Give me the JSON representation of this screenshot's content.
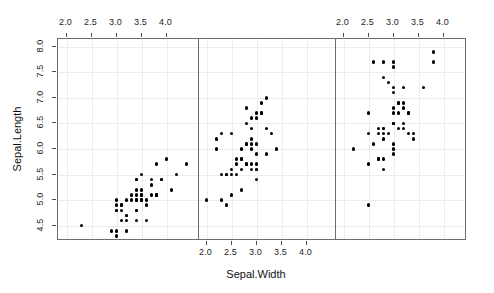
{
  "chart_data": {
    "type": "scatter",
    "title": "",
    "xlabel": "Sepal.Width",
    "ylabel": "Sepal.Length",
    "xlim": [
      1.85,
      4.55
    ],
    "ylim": [
      4.2,
      8.15
    ],
    "xticks": [
      2.0,
      2.5,
      3.0,
      3.5,
      4.0
    ],
    "xticklabels": [
      "2.0",
      "2.5",
      "3.0",
      "3.5",
      "4.0"
    ],
    "yticks": [
      4.5,
      5.0,
      5.5,
      6.0,
      6.5,
      7.0,
      7.5,
      8.0
    ],
    "yticklabels": [
      "4.5",
      "5.0",
      "5.5",
      "6.0",
      "6.5",
      "7.0",
      "7.5",
      "8.0"
    ],
    "grid": true,
    "legend": "none",
    "point_color": "#000000",
    "frame_color": "#6e6e6e",
    "grid_color": "#ececec",
    "conditioned": true,
    "panel_count": 3,
    "panels": [
      {
        "name": "panel-1",
        "axis_position": "top",
        "points": [
          [
            3.5,
            5.1
          ],
          [
            3.0,
            4.9
          ],
          [
            3.2,
            4.7
          ],
          [
            3.1,
            4.6
          ],
          [
            3.6,
            5.0
          ],
          [
            3.9,
            5.4
          ],
          [
            3.4,
            4.6
          ],
          [
            3.4,
            5.0
          ],
          [
            2.9,
            4.4
          ],
          [
            3.1,
            4.9
          ],
          [
            3.7,
            5.4
          ],
          [
            3.4,
            4.8
          ],
          [
            3.0,
            4.8
          ],
          [
            3.0,
            4.3
          ],
          [
            4.0,
            5.8
          ],
          [
            4.4,
            5.7
          ],
          [
            3.9,
            5.4
          ],
          [
            3.5,
            5.1
          ],
          [
            3.8,
            5.7
          ],
          [
            3.8,
            5.1
          ],
          [
            3.4,
            5.4
          ],
          [
            3.7,
            5.1
          ],
          [
            3.6,
            4.6
          ],
          [
            3.3,
            5.1
          ],
          [
            3.4,
            4.8
          ],
          [
            3.0,
            5.0
          ],
          [
            3.4,
            5.0
          ],
          [
            3.5,
            5.2
          ],
          [
            3.4,
            5.2
          ],
          [
            3.2,
            4.7
          ],
          [
            3.1,
            4.8
          ],
          [
            3.4,
            5.4
          ],
          [
            4.1,
            5.2
          ],
          [
            4.2,
            5.5
          ],
          [
            3.1,
            4.9
          ],
          [
            3.2,
            5.0
          ],
          [
            3.5,
            5.5
          ],
          [
            3.6,
            4.9
          ],
          [
            3.0,
            4.4
          ],
          [
            3.4,
            5.1
          ],
          [
            3.5,
            5.0
          ],
          [
            2.3,
            4.5
          ],
          [
            3.2,
            4.4
          ],
          [
            3.5,
            5.0
          ],
          [
            3.8,
            5.1
          ],
          [
            3.0,
            4.8
          ],
          [
            3.8,
            5.1
          ],
          [
            3.2,
            4.6
          ],
          [
            3.7,
            5.3
          ],
          [
            3.3,
            5.0
          ]
        ]
      },
      {
        "name": "panel-2",
        "axis_position": "bottom",
        "points": [
          [
            3.2,
            7.0
          ],
          [
            3.2,
            6.4
          ],
          [
            3.1,
            6.9
          ],
          [
            2.3,
            5.5
          ],
          [
            2.8,
            6.5
          ],
          [
            2.8,
            5.7
          ],
          [
            3.3,
            6.3
          ],
          [
            2.4,
            4.9
          ],
          [
            2.9,
            6.6
          ],
          [
            2.7,
            5.2
          ],
          [
            2.0,
            5.0
          ],
          [
            3.0,
            5.9
          ],
          [
            2.2,
            6.0
          ],
          [
            2.9,
            6.1
          ],
          [
            2.9,
            5.6
          ],
          [
            3.1,
            6.7
          ],
          [
            3.0,
            5.6
          ],
          [
            2.7,
            5.8
          ],
          [
            2.2,
            6.2
          ],
          [
            2.5,
            5.6
          ],
          [
            3.2,
            5.9
          ],
          [
            2.8,
            6.1
          ],
          [
            2.5,
            6.3
          ],
          [
            2.8,
            6.1
          ],
          [
            2.9,
            6.4
          ],
          [
            3.0,
            6.6
          ],
          [
            2.8,
            6.8
          ],
          [
            3.0,
            6.7
          ],
          [
            2.9,
            6.0
          ],
          [
            2.6,
            5.7
          ],
          [
            2.4,
            5.5
          ],
          [
            2.4,
            5.5
          ],
          [
            2.7,
            5.8
          ],
          [
            2.7,
            6.0
          ],
          [
            3.0,
            5.4
          ],
          [
            3.4,
            6.0
          ],
          [
            3.1,
            6.7
          ],
          [
            2.3,
            6.3
          ],
          [
            3.0,
            5.6
          ],
          [
            2.5,
            5.5
          ],
          [
            2.6,
            5.5
          ],
          [
            3.0,
            6.1
          ],
          [
            2.6,
            5.8
          ],
          [
            2.3,
            5.0
          ],
          [
            2.7,
            5.6
          ],
          [
            3.0,
            5.7
          ],
          [
            2.9,
            5.7
          ],
          [
            2.9,
            6.2
          ],
          [
            2.5,
            5.1
          ],
          [
            2.8,
            5.7
          ]
        ]
      },
      {
        "name": "panel-3",
        "axis_position": "top",
        "points": [
          [
            3.3,
            6.3
          ],
          [
            2.7,
            5.8
          ],
          [
            3.0,
            7.1
          ],
          [
            2.9,
            6.3
          ],
          [
            3.0,
            6.5
          ],
          [
            3.0,
            7.6
          ],
          [
            2.5,
            4.9
          ],
          [
            2.9,
            7.3
          ],
          [
            2.5,
            6.7
          ],
          [
            3.6,
            7.2
          ],
          [
            3.2,
            6.5
          ],
          [
            2.7,
            6.4
          ],
          [
            3.0,
            6.8
          ],
          [
            2.5,
            5.7
          ],
          [
            2.8,
            5.8
          ],
          [
            3.2,
            6.4
          ],
          [
            3.0,
            6.5
          ],
          [
            3.8,
            7.7
          ],
          [
            2.6,
            7.7
          ],
          [
            2.2,
            6.0
          ],
          [
            3.2,
            6.9
          ],
          [
            2.8,
            5.6
          ],
          [
            2.8,
            7.7
          ],
          [
            2.7,
            6.3
          ],
          [
            3.3,
            6.7
          ],
          [
            3.2,
            7.2
          ],
          [
            2.8,
            6.2
          ],
          [
            3.0,
            6.1
          ],
          [
            2.8,
            6.4
          ],
          [
            3.0,
            7.2
          ],
          [
            2.8,
            7.4
          ],
          [
            3.8,
            7.9
          ],
          [
            2.8,
            6.4
          ],
          [
            2.8,
            6.3
          ],
          [
            2.6,
            6.1
          ],
          [
            3.0,
            7.7
          ],
          [
            3.4,
            6.3
          ],
          [
            3.1,
            6.4
          ],
          [
            3.0,
            6.0
          ],
          [
            3.1,
            6.9
          ],
          [
            3.1,
            6.7
          ],
          [
            3.1,
            6.9
          ],
          [
            2.7,
            5.8
          ],
          [
            3.2,
            6.8
          ],
          [
            3.3,
            6.7
          ],
          [
            3.0,
            6.7
          ],
          [
            2.5,
            6.3
          ],
          [
            3.0,
            6.5
          ],
          [
            3.4,
            6.2
          ],
          [
            3.0,
            5.9
          ]
        ]
      }
    ]
  }
}
